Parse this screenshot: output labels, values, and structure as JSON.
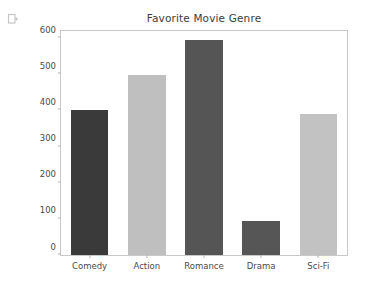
{
  "icons": {
    "output_glyph": "copy-add-icon"
  },
  "figure": {
    "title": "Favorite Movie Genre",
    "background": "#ffffff",
    "frame_color": "#c9c9c9",
    "tick_color": "#4a4a4a"
  },
  "chart_data": {
    "type": "bar",
    "title": "Favorite Movie Genre",
    "xlabel": "",
    "ylabel": "",
    "categories": [
      "Comedy",
      "Action",
      "Romance",
      "Drama",
      "Sci-Fi"
    ],
    "values": [
      400,
      497,
      595,
      93,
      391
    ],
    "colors": [
      "#3a3a3a",
      "#bfbfbf",
      "#555555",
      "#565656",
      "#c2c2c2"
    ],
    "ylim": [
      0,
      620
    ],
    "yticks": [
      0,
      100,
      200,
      300,
      400,
      500,
      600
    ],
    "ytick_labels": [
      "0",
      "100",
      "200",
      "300",
      "400",
      "500",
      "600"
    ],
    "grid": false,
    "legend": null
  }
}
